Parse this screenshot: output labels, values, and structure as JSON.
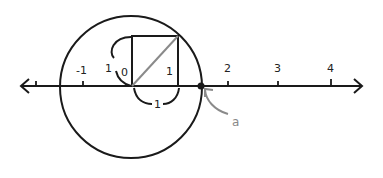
{
  "diagram": {
    "title": "",
    "number_line": {
      "ticks": [
        {
          "x": 36,
          "label": ""
        },
        {
          "x": 83,
          "label": "-1"
        },
        {
          "x": 178,
          "label": "1"
        },
        {
          "x": 228,
          "label": "2"
        },
        {
          "x": 278,
          "label": "3"
        },
        {
          "x": 331,
          "label": "4"
        }
      ],
      "origin_label": "0"
    },
    "square": {
      "left_side_label": "1",
      "right_side_label": "1",
      "bottom_side_label": "1"
    },
    "point": {
      "label": "a"
    },
    "colors": {
      "stroke": "#1a1a1a",
      "diagonal": "#8a8a8a",
      "annotation": "#8a8a8a"
    }
  }
}
